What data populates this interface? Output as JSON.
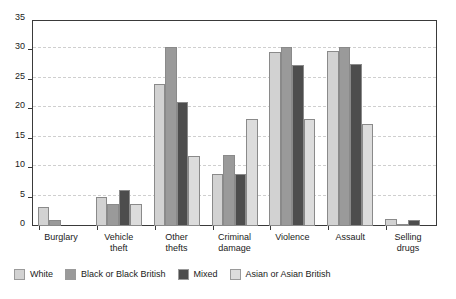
{
  "chart_data": {
    "type": "bar",
    "title": "",
    "subtitle": "",
    "xlabel": "",
    "ylabel": "",
    "ylim": [
      0,
      35
    ],
    "ytick_step": 5,
    "yticks": [
      0,
      5,
      10,
      15,
      20,
      25,
      30,
      35
    ],
    "ytick_labels": [
      "0",
      "5",
      "10",
      "15",
      "20",
      "25",
      "30",
      "35"
    ],
    "grid": "horizontal-dashed",
    "legend_position": "bottom-left",
    "categories": [
      "Burglary",
      "Vehicle\ntheft",
      "Other\nthefts",
      "Criminal\ndamage",
      "Violence",
      "Assault",
      "Selling\ndrugs"
    ],
    "series": [
      {
        "name": "White",
        "color": "#d2d2d2",
        "values": [
          3.3,
          5.0,
          24.2,
          8.8,
          29.5,
          29.7,
          1.2
        ]
      },
      {
        "name": "Black or Black British",
        "color": "#9a9a9a",
        "values": [
          1.0,
          3.7,
          30.5,
          12.0,
          30.5,
          30.5,
          0.2
        ]
      },
      {
        "name": "Mixed",
        "color": "#4d4d4d",
        "values": [
          0.0,
          6.2,
          21.0,
          8.9,
          27.4,
          27.5,
          1.0
        ]
      },
      {
        "name": "Asian or Asian British",
        "color": "#dcdcdc",
        "values": [
          0.0,
          3.7,
          11.9,
          18.1,
          18.1,
          17.4,
          0.0
        ]
      }
    ]
  },
  "legend": {
    "items": [
      {
        "label": "White",
        "color": "#d2d2d2"
      },
      {
        "label": "Black or Black British",
        "color": "#9a9a9a"
      },
      {
        "label": "Mixed",
        "color": "#4d4d4d"
      },
      {
        "label": "Asian or Asian British",
        "color": "#dcdcdc"
      }
    ]
  },
  "colors": {
    "axis": "#3a3a3a",
    "gridline": "#cfcfcf",
    "background": "#ffffff",
    "text": "#1a1a1a"
  }
}
